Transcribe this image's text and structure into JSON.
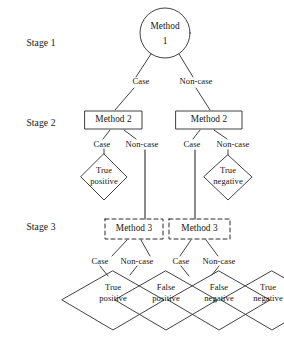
{
  "diagram": {
    "background_color": "#ffffff",
    "stroke_color": "#2b2b2b",
    "text_color": "#161616",
    "stages": [
      {
        "id": "stage1",
        "label": "Stage 1",
        "x": 41,
        "y": 43
      },
      {
        "id": "stage2",
        "label": "Stage 2",
        "x": 41,
        "y": 123
      },
      {
        "id": "stage3",
        "label": "Stage 3",
        "x": 41,
        "y": 227
      }
    ],
    "nodes": [
      {
        "id": "method1",
        "shape": "circle",
        "line_style": "solid",
        "text_line1": "Method",
        "text_line2": "1",
        "cx": 165,
        "cy": 33,
        "r": 25
      },
      {
        "id": "method2-left",
        "shape": "rect",
        "line_style": "solid",
        "text": "Method 2",
        "x": 85,
        "y": 111,
        "w": 57,
        "h": 18
      },
      {
        "id": "method2-right",
        "shape": "rect",
        "line_style": "solid",
        "text": "Method 2",
        "x": 176,
        "y": 111,
        "w": 66,
        "h": 18
      },
      {
        "id": "method3-left",
        "shape": "rect",
        "line_style": "dashed",
        "text": "Method 3",
        "x": 105,
        "y": 219,
        "w": 58,
        "h": 20
      },
      {
        "id": "method3-right",
        "shape": "rect",
        "line_style": "dashed",
        "text": "Method 3",
        "x": 169,
        "y": 219,
        "w": 61,
        "h": 20
      },
      {
        "id": "true-positive-stage2",
        "shape": "diamond",
        "line_style": "solid",
        "text_line1": "True",
        "text_line2": "positive",
        "cx": 104,
        "cy": 177,
        "rx": 23,
        "ry": 23
      },
      {
        "id": "true-negative-stage2",
        "shape": "diamond",
        "line_style": "solid",
        "text_line1": "True",
        "text_line2": "negative",
        "cx": 228,
        "cy": 177,
        "rx": 24,
        "ry": 23
      },
      {
        "id": "true-positive-stage3",
        "shape": "diamond",
        "line_style": "solid",
        "text_line1": "True",
        "text_line2": "positive",
        "cx": 113,
        "cy": 300,
        "rx": 51,
        "ry": 30
      },
      {
        "id": "false-positive-stage3",
        "shape": "diamond",
        "line_style": "solid",
        "text_line1": "False",
        "text_line2": "positive",
        "cx": 166,
        "cy": 300,
        "rx": 51,
        "ry": 30
      },
      {
        "id": "false-negative-stage3",
        "shape": "diamond",
        "line_style": "solid",
        "text_line1": "False",
        "text_line2": "negative",
        "cx": 219,
        "cy": 300,
        "rx": 51,
        "ry": 30
      },
      {
        "id": "true-negative-stage3",
        "shape": "diamond",
        "line_style": "solid",
        "text_line1": "True",
        "text_line2": "negative",
        "cx": 272,
        "cy": 300,
        "rx": 51,
        "ry": 30
      }
    ],
    "edge_labels": [
      {
        "id": "s1-case",
        "label": "Case",
        "x": 141,
        "y": 81
      },
      {
        "id": "s1-noncase",
        "label": "Non-case",
        "x": 196,
        "y": 81
      },
      {
        "id": "s2l-case",
        "label": "Case",
        "x": 102,
        "y": 144
      },
      {
        "id": "s2l-noncase",
        "label": "Non-case",
        "x": 142,
        "y": 144
      },
      {
        "id": "s2r-case",
        "label": "Case",
        "x": 192,
        "y": 144
      },
      {
        "id": "s2r-noncase",
        "label": "Non-case",
        "x": 233,
        "y": 144
      },
      {
        "id": "s3l-case",
        "label": "Case",
        "x": 100,
        "y": 261
      },
      {
        "id": "s3l-noncase",
        "label": "Non-case",
        "x": 137,
        "y": 261
      },
      {
        "id": "s3r-case",
        "label": "Case",
        "x": 181,
        "y": 261
      },
      {
        "id": "s3r-noncase",
        "label": "Non-case",
        "x": 219,
        "y": 261
      }
    ]
  }
}
